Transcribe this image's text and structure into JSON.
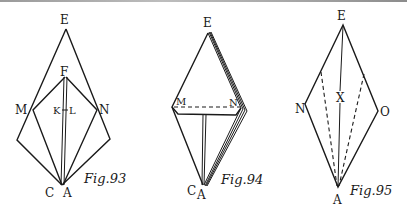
{
  "figures": [
    {
      "id": "fig93",
      "caption": "Fig.93",
      "labels": {
        "E": "E",
        "F": "F",
        "M": "M",
        "N": "N",
        "K": "K",
        "L": "L",
        "C": "C",
        "A": "A"
      }
    },
    {
      "id": "fig94",
      "caption": "Fig.94",
      "labels": {
        "E": "E",
        "M": "M",
        "N": "N",
        "C": "C",
        "A": "A"
      }
    },
    {
      "id": "fig95",
      "caption": "Fig.95",
      "labels": {
        "E": "E",
        "N": "N",
        "X": "X",
        "O": "O",
        "A": "A"
      }
    }
  ],
  "colors": {
    "ink": "#1a1a1a",
    "paper": "#ffffff"
  }
}
